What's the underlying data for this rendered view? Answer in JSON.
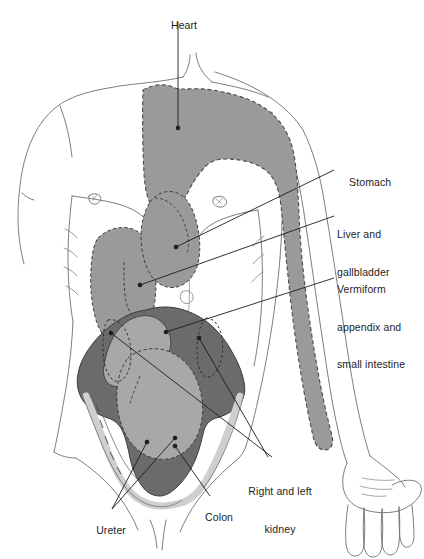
{
  "figure": {
    "type": "anatomical-diagram",
    "background_color": "#ffffff",
    "outline_color": "#6e6e6e",
    "colors": {
      "heart_and_great_vessels": "#9a9a9a",
      "liver_and_gallbladder": "#9a9a9a",
      "stomach": "#9a9a9a",
      "colon": "#6b6b6b",
      "small_intestine": "#a8a8a8",
      "ureter": "#cfcfcf",
      "leader_line": "#1c1c1c",
      "label_text": "#1c1c1c"
    }
  },
  "labels": [
    {
      "id": "heart",
      "text": "Heart",
      "align": "center",
      "x": 178,
      "y": 8,
      "width": 40,
      "leader": [
        [
          178,
          22
        ],
        [
          178,
          128
        ]
      ]
    },
    {
      "id": "stomach",
      "text": "Stomach",
      "align": "left",
      "x": 337,
      "y": 163,
      "width": 70,
      "leader": [
        [
          334,
          170
        ],
        [
          176,
          247
        ]
      ]
    },
    {
      "id": "liver-and-gallbladder",
      "text": "Liver and\ngallbladder",
      "line1": "Liver and",
      "line2": "gallbladder",
      "align": "left",
      "x": 337,
      "y": 203,
      "width": 72,
      "leader": [
        [
          334,
          216
        ],
        [
          140,
          285
        ]
      ]
    },
    {
      "id": "vermiform-appendix-and-small-intestine",
      "text": "Vermiform\nappendix and\nsmall intestine",
      "line1": "Vermiform",
      "line2": "appendix and",
      "line3": "small intestine",
      "align": "left",
      "x": 337,
      "y": 258,
      "width": 84,
      "leader": [
        [
          334,
          278
        ],
        [
          166,
          332
        ]
      ]
    },
    {
      "id": "right-and-left-kidney",
      "text": "Right and left\nkidney",
      "line1": "Right and left",
      "line2": "kidney",
      "align": "center",
      "x": 237,
      "y": 461,
      "width": 86,
      "leader_left": [
        [
          268,
          458
        ],
        [
          199,
          338
        ]
      ],
      "leader_right": [
        [
          276,
          458
        ],
        [
          224,
          418
        ]
      ]
    },
    {
      "id": "colon",
      "text": "Colon",
      "align": "center",
      "x": 193,
      "y": 499,
      "width": 40,
      "leader": [
        [
          210,
          497
        ],
        [
          175,
          446
        ]
      ]
    },
    {
      "id": "ureter",
      "text": "Ureter",
      "align": "center",
      "x": 84,
      "y": 512,
      "width": 44,
      "leader_a": [
        [
          112,
          511
        ],
        [
          148,
          443
        ]
      ],
      "leader_b": [
        [
          112,
          511
        ],
        [
          172,
          443
        ]
      ]
    }
  ],
  "organs": [
    {
      "id": "heart-great-vessels",
      "label": "Heart",
      "fill": "#9a9a9a",
      "outline": "dashed"
    },
    {
      "id": "liver",
      "label": "Liver and gallbladder",
      "fill": "#9a9a9a",
      "outline": "dashed"
    },
    {
      "id": "stomach",
      "label": "Stomach",
      "fill": "#9a9a9a",
      "outline": "dashed"
    },
    {
      "id": "colon",
      "label": "Colon",
      "fill": "#6b6b6b",
      "outline": "solid"
    },
    {
      "id": "small-intestine",
      "label": "Vermiform appendix and small intestine",
      "fill": "#a8a8a8",
      "outline": "dashed"
    },
    {
      "id": "kidney-left",
      "label": "Left kidney",
      "fill": "none",
      "outline": "dashed"
    },
    {
      "id": "kidney-right",
      "label": "Right kidney",
      "fill": "none",
      "outline": "dashed"
    },
    {
      "id": "ureter",
      "label": "Ureter",
      "fill": "#cfcfcf",
      "outline": "solid"
    }
  ]
}
